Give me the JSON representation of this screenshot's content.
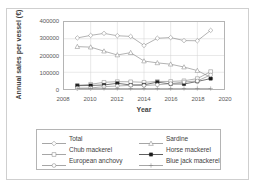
{
  "chart_data": {
    "type": "line",
    "title": "",
    "xlabel": "Year",
    "ylabel": "Annual sales per vessel (€)",
    "xlim": [
      2008,
      2020
    ],
    "ylim": [
      0,
      400000
    ],
    "xticks": [
      "2008",
      "2010",
      "2012",
      "2014",
      "2016",
      "2018",
      "2020"
    ],
    "yticks": [
      "0",
      "100000",
      "200000",
      "300000",
      "400000"
    ],
    "grid": true,
    "legend_position": "bottom",
    "x": [
      2009,
      2010,
      2011,
      2012,
      2013,
      2014,
      2015,
      2016,
      2017,
      2018,
      2019
    ],
    "series": [
      {
        "name": "Total",
        "marker": "diamond-open",
        "color": "#808080",
        "values": [
          305000,
          320000,
          332000,
          318000,
          314000,
          260000,
          303000,
          307000,
          289000,
          288000,
          350000
        ]
      },
      {
        "name": "Sardine",
        "marker": "triangle-open",
        "color": "#808080",
        "values": [
          253000,
          250000,
          226000,
          203000,
          217000,
          167000,
          156000,
          148000,
          131000,
          110000,
          70000
        ]
      },
      {
        "name": "Chub mackerel",
        "marker": "square-open",
        "color": "#808080",
        "values": [
          22000,
          28000,
          40000,
          44000,
          43000,
          40000,
          45000,
          45000,
          49000,
          62000,
          104000
        ]
      },
      {
        "name": "Horse mackerel",
        "marker": "square-filled",
        "color": "#1a1a1a",
        "values": [
          20000,
          21000,
          24000,
          34000,
          24000,
          25000,
          41000,
          30000,
          30000,
          45000,
          62000
        ]
      },
      {
        "name": "European anchovy",
        "marker": "circle-open",
        "color": "#808080",
        "values": [
          5000,
          6000,
          14000,
          18000,
          22000,
          21000,
          25000,
          32000,
          42000,
          48000,
          84000
        ]
      },
      {
        "name": "Blue jack mackerel",
        "marker": "plus",
        "color": "#808080",
        "values": [
          3000,
          3000,
          3000,
          3000,
          3000,
          3000,
          3000,
          3000,
          3000,
          3000,
          3000
        ]
      }
    ]
  },
  "legend": {
    "entries": [
      {
        "label": "Total"
      },
      {
        "label": "Sardine"
      },
      {
        "label": "Chub mackerel"
      },
      {
        "label": "Horse mackerel"
      },
      {
        "label": "European anchovy"
      },
      {
        "label": "Blue jack mackerel"
      }
    ]
  }
}
